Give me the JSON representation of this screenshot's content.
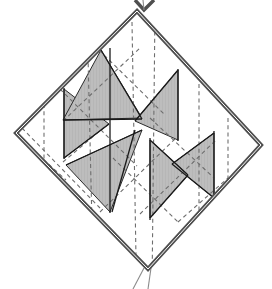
{
  "figure": {
    "canvas": {
      "width": 272,
      "height": 289
    },
    "colors": {
      "background": "#ffffff",
      "outline": "#4f4f4f",
      "crease_solid": "#1a1a1a",
      "crease_dashed": "#6e6e6e",
      "shade_fill": "#bdbdbd",
      "shade_stroke": "#2b2b2b"
    },
    "stroke_widths": {
      "outline": 4.2,
      "outline_inner": 1.2,
      "crease_solid": 1.3,
      "crease_dashed": 1.1
    },
    "dash_pattern": "4,3.2"
  },
  "outline": {
    "name": "square-sheet-boundary",
    "vertices": [
      {
        "label": "top",
        "x": 137,
        "y": 11
      },
      {
        "label": "right",
        "x": 261,
        "y": 145
      },
      {
        "label": "bottom",
        "x": 148,
        "y": 269
      },
      {
        "label": "left",
        "x": 16,
        "y": 133
      }
    ]
  },
  "markers": {
    "top_chevron": {
      "name": "top-tip-chevron",
      "points": "135,0 144,10 154,0"
    },
    "top_stem": {
      "name": "top-tip-stem",
      "x1": 144,
      "y1": 10,
      "x2": 143,
      "y2": 0
    },
    "bottom_tail_left": {
      "name": "bottom-tail-left-line",
      "x1": 144,
      "y1": 268,
      "x2": 133,
      "y2": 289
    },
    "bottom_tail_right": {
      "name": "bottom-tail-right-line",
      "x1": 151,
      "y1": 268,
      "x2": 148,
      "y2": 289
    }
  },
  "shaded_triangles": [
    {
      "name": "shade-left-upper",
      "points": "64,89 64,158 109,124"
    },
    {
      "name": "shade-top-center",
      "points": "101,50 142,118 63,120"
    },
    {
      "name": "shade-right-upper",
      "points": "178,70 178,140 135,121"
    },
    {
      "name": "shade-right-mid",
      "points": "214,133 214,198 172,164"
    },
    {
      "name": "shade-bottom-center",
      "points": "110,212 142,130 66,165"
    },
    {
      "name": "shade-right-lower",
      "points": "150,218 150,140 188,175"
    }
  ],
  "solid_creases": [
    {
      "name": "crease-solid-left-vertical",
      "x1": 64,
      "y1": 88,
      "x2": 64,
      "y2": 159
    },
    {
      "name": "crease-solid-center-left-vertical",
      "x1": 110,
      "y1": 48,
      "x2": 110,
      "y2": 213
    },
    {
      "name": "crease-solid-right-vertical",
      "x1": 178,
      "y1": 69,
      "x2": 178,
      "y2": 141
    },
    {
      "name": "crease-solid-center-right-vert",
      "x1": 150,
      "y1": 138,
      "x2": 150,
      "y2": 220
    },
    {
      "name": "crease-solid-far-right-vertical",
      "x1": 214,
      "y1": 131,
      "x2": 214,
      "y2": 200
    },
    {
      "name": "crease-solid-diag-a",
      "x1": 101,
      "y1": 50,
      "x2": 142,
      "y2": 119
    },
    {
      "name": "crease-solid-diag-b",
      "x1": 142,
      "y1": 119,
      "x2": 63,
      "y2": 120
    },
    {
      "name": "crease-solid-diag-c",
      "x1": 64,
      "y1": 158,
      "x2": 109,
      "y2": 124
    },
    {
      "name": "crease-solid-diag-d",
      "x1": 178,
      "y1": 70,
      "x2": 135,
      "y2": 121
    },
    {
      "name": "crease-solid-diag-e",
      "x1": 135,
      "y1": 130,
      "x2": 112,
      "y2": 212
    },
    {
      "name": "crease-solid-diag-f",
      "x1": 142,
      "y1": 130,
      "x2": 66,
      "y2": 165
    },
    {
      "name": "crease-solid-diag-g",
      "x1": 150,
      "y1": 218,
      "x2": 188,
      "y2": 175
    },
    {
      "name": "crease-solid-diag-h",
      "x1": 188,
      "y1": 175,
      "x2": 150,
      "y2": 140
    },
    {
      "name": "crease-solid-diag-i",
      "x1": 214,
      "y1": 198,
      "x2": 172,
      "y2": 164
    },
    {
      "name": "crease-solid-diag-j",
      "x1": 172,
      "y1": 164,
      "x2": 214,
      "y2": 133
    }
  ],
  "dashed_creases": [
    {
      "name": "crease-dashed-v1",
      "x1": 44,
      "y1": 104,
      "x2": 44,
      "y2": 188
    },
    {
      "name": "crease-dashed-v2",
      "x1": 88,
      "y1": 56,
      "x2": 92,
      "y2": 224
    },
    {
      "name": "crease-dashed-v3",
      "x1": 132,
      "y1": 22,
      "x2": 136,
      "y2": 258
    },
    {
      "name": "crease-dashed-v4",
      "x1": 155,
      "y1": 10,
      "x2": 152,
      "y2": 289
    },
    {
      "name": "crease-dashed-v5",
      "x1": 199,
      "y1": 84,
      "x2": 199,
      "y2": 245
    },
    {
      "name": "crease-dashed-v6",
      "x1": 228,
      "y1": 118,
      "x2": 228,
      "y2": 215
    },
    {
      "name": "crease-dashed-d1",
      "x1": 99,
      "y1": 50,
      "x2": 164,
      "y2": 114
    },
    {
      "name": "crease-dashed-d2",
      "x1": 60,
      "y1": 89,
      "x2": 137,
      "y2": 166
    },
    {
      "name": "crease-dashed-d3",
      "x1": 22,
      "y1": 128,
      "x2": 100,
      "y2": 208
    },
    {
      "name": "crease-dashed-d4",
      "x1": 150,
      "y1": 118,
      "x2": 214,
      "y2": 178
    },
    {
      "name": "crease-dashed-d5",
      "x1": 113,
      "y1": 158,
      "x2": 178,
      "y2": 222
    },
    {
      "name": "crease-dashed-d6",
      "x1": 63,
      "y1": 121,
      "x2": 140,
      "y2": 48
    },
    {
      "name": "crease-dashed-d7",
      "x1": 100,
      "y1": 212,
      "x2": 178,
      "y2": 136
    },
    {
      "name": "crease-dashed-d8",
      "x1": 63,
      "y1": 162,
      "x2": 108,
      "y2": 124
    },
    {
      "name": "crease-dashed-d9",
      "x1": 140,
      "y1": 214,
      "x2": 216,
      "y2": 140
    },
    {
      "name": "crease-dashed-d10",
      "x1": 178,
      "y1": 222,
      "x2": 228,
      "y2": 178
    },
    {
      "name": "crease-dashed-d11",
      "x1": 22,
      "y1": 140,
      "x2": 66,
      "y2": 180
    }
  ]
}
